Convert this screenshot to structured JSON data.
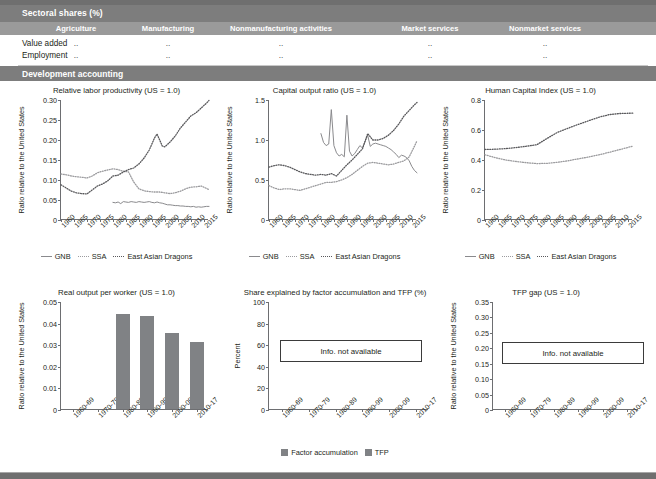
{
  "table": {
    "section_title": "Sectoral shares (%)",
    "columns": [
      "Agriculture",
      "Manufacturing",
      "Nonmanufacturing activities",
      "Market services",
      "Nonmarket services"
    ],
    "rows": [
      {
        "label": "Value added",
        "values": [
          "..",
          "..",
          "..",
          "..",
          ".."
        ]
      },
      {
        "label": "Employment",
        "values": [
          "..",
          "..",
          "..",
          "..",
          ".."
        ]
      }
    ],
    "section_title_2": "Development accounting"
  },
  "legend": {
    "gnb": "GNB",
    "ssa": "SSA",
    "ead": "East Asian Dragons",
    "factor_accumulation": "Factor accumulation",
    "tfp": "TFP"
  },
  "na_text": "Info. not available",
  "colors": {
    "band": "#7d7d7d",
    "colheader": "#9a9a9a",
    "gnb": "#8a8a8d",
    "ssa": "#9b9b9e",
    "ead": "#58585b",
    "bar": "#808285",
    "axis": "#6d6e71"
  },
  "chart_data": [
    {
      "id": "relative-labor-productivity",
      "type": "line",
      "title": "Relative labor productivity (US = 1.0)",
      "xlabel": "",
      "ylabel": "Ratio relative to the United States",
      "ylim": [
        0,
        0.3
      ],
      "yticks": [
        0,
        0.05,
        0.1,
        0.15,
        0.2,
        0.25,
        0.3
      ],
      "ytick_labels": [
        "0",
        "0.05",
        "0.10",
        "0.15",
        "0.20",
        "0.25",
        "0.30"
      ],
      "xlim": [
        1960,
        2017
      ],
      "xticks": [
        1960,
        1965,
        1970,
        1975,
        1980,
        1985,
        1990,
        1995,
        2000,
        2005,
        2010,
        2015
      ],
      "grid": false,
      "legend_position": "below",
      "series": [
        {
          "name": "GNB",
          "style": "solid",
          "x": [
            1980,
            1981,
            1982,
            1983,
            1984,
            1985,
            1986,
            1987,
            1988,
            1989,
            1990,
            1991,
            1992,
            1993,
            1994,
            1995,
            1996,
            1997,
            1998,
            1999,
            2000,
            2001,
            2002,
            2003,
            2004,
            2005,
            2006,
            2007,
            2008,
            2009,
            2010,
            2011,
            2012,
            2013,
            2014,
            2015,
            2016,
            2017
          ],
          "values": [
            0.044,
            0.043,
            0.045,
            0.041,
            0.046,
            0.045,
            0.044,
            0.046,
            0.045,
            0.044,
            0.046,
            0.045,
            0.044,
            0.045,
            0.046,
            0.044,
            0.043,
            0.045,
            0.043,
            0.042,
            0.04,
            0.038,
            0.038,
            0.037,
            0.036,
            0.036,
            0.035,
            0.035,
            0.034,
            0.034,
            0.033,
            0.034,
            0.032,
            0.033,
            0.032,
            0.033,
            0.034,
            0.034
          ]
        },
        {
          "name": "SSA",
          "style": "dotted",
          "x": [
            1960,
            1962,
            1964,
            1966,
            1968,
            1970,
            1972,
            1974,
            1976,
            1978,
            1980,
            1982,
            1984,
            1986,
            1988,
            1990,
            1992,
            1994,
            1996,
            1998,
            2000,
            2002,
            2004,
            2006,
            2008,
            2010,
            2012,
            2014,
            2016,
            2017
          ],
          "values": [
            0.115,
            0.113,
            0.11,
            0.108,
            0.107,
            0.105,
            0.11,
            0.118,
            0.122,
            0.125,
            0.128,
            0.126,
            0.122,
            0.12,
            0.095,
            0.078,
            0.073,
            0.071,
            0.07,
            0.07,
            0.068,
            0.066,
            0.068,
            0.072,
            0.078,
            0.082,
            0.083,
            0.085,
            0.079,
            0.076
          ]
        },
        {
          "name": "East Asian Dragons",
          "style": "dotted-dark",
          "x": [
            1960,
            1962,
            1964,
            1966,
            1968,
            1970,
            1972,
            1974,
            1976,
            1978,
            1980,
            1982,
            1984,
            1986,
            1988,
            1990,
            1992,
            1994,
            1996,
            1997,
            1998,
            1999,
            2000,
            2002,
            2004,
            2006,
            2008,
            2010,
            2012,
            2014,
            2016,
            2017
          ],
          "values": [
            0.088,
            0.08,
            0.072,
            0.068,
            0.066,
            0.065,
            0.075,
            0.085,
            0.09,
            0.098,
            0.11,
            0.112,
            0.12,
            0.126,
            0.13,
            0.14,
            0.155,
            0.175,
            0.205,
            0.215,
            0.2,
            0.185,
            0.183,
            0.195,
            0.21,
            0.23,
            0.245,
            0.26,
            0.268,
            0.28,
            0.292,
            0.299
          ]
        }
      ]
    },
    {
      "id": "capital-output-ratio",
      "type": "line",
      "title": "Capital output ratio (US = 1.0)",
      "xlabel": "",
      "ylabel": "Ratio relative to the United States",
      "ylim": [
        0,
        1.5
      ],
      "yticks": [
        0,
        0.5,
        1.0,
        1.5
      ],
      "ytick_labels": [
        "0",
        "0.5",
        "1.0",
        "1.5"
      ],
      "xlim": [
        1960,
        2017
      ],
      "xticks": [
        1960,
        1965,
        1970,
        1975,
        1980,
        1985,
        1990,
        1995,
        2000,
        2005,
        2010,
        2015
      ],
      "grid": false,
      "legend_position": "below",
      "series": [
        {
          "name": "GNB",
          "style": "solid",
          "x": [
            1980,
            1981,
            1982,
            1983,
            1984,
            1985,
            1986,
            1987,
            1988,
            1989,
            1990,
            1991,
            1992,
            1993,
            1994,
            1995,
            1996,
            1997,
            1998,
            1999,
            2000,
            2001,
            2002,
            2003,
            2004,
            2005,
            2006,
            2007,
            2008,
            2009,
            2010,
            2011,
            2012,
            2013,
            2014,
            2015,
            2016,
            2017
          ],
          "values": [
            1.08,
            0.97,
            0.93,
            0.95,
            1.38,
            0.93,
            0.84,
            0.8,
            0.82,
            0.79,
            1.31,
            0.86,
            0.8,
            0.83,
            0.88,
            0.93,
            0.9,
            0.98,
            1.06,
            0.92,
            0.95,
            0.96,
            0.95,
            0.94,
            0.93,
            0.92,
            0.9,
            0.88,
            0.85,
            0.82,
            0.78,
            0.81,
            0.8,
            0.78,
            0.74,
            0.67,
            0.62,
            0.59
          ]
        },
        {
          "name": "SSA",
          "style": "dotted",
          "x": [
            1960,
            1962,
            1964,
            1966,
            1968,
            1970,
            1972,
            1974,
            1976,
            1978,
            1980,
            1982,
            1984,
            1986,
            1988,
            1990,
            1992,
            1994,
            1996,
            1998,
            2000,
            2002,
            2004,
            2006,
            2008,
            2010,
            2012,
            2014,
            2016,
            2017
          ],
          "values": [
            0.43,
            0.4,
            0.38,
            0.39,
            0.39,
            0.38,
            0.37,
            0.39,
            0.41,
            0.43,
            0.45,
            0.47,
            0.47,
            0.48,
            0.5,
            0.53,
            0.57,
            0.62,
            0.67,
            0.71,
            0.72,
            0.71,
            0.7,
            0.69,
            0.7,
            0.72,
            0.74,
            0.79,
            0.92,
            0.99
          ]
        },
        {
          "name": "East Asian Dragons",
          "style": "dotted-dark",
          "x": [
            1960,
            1962,
            1964,
            1966,
            1968,
            1970,
            1972,
            1974,
            1976,
            1978,
            1980,
            1982,
            1984,
            1986,
            1988,
            1990,
            1992,
            1994,
            1996,
            1998,
            2000,
            2002,
            2004,
            2006,
            2008,
            2010,
            2012,
            2014,
            2016,
            2017
          ],
          "values": [
            0.66,
            0.68,
            0.69,
            0.68,
            0.66,
            0.63,
            0.6,
            0.58,
            0.57,
            0.56,
            0.57,
            0.56,
            0.58,
            0.55,
            0.62,
            0.69,
            0.75,
            0.82,
            0.89,
            1.08,
            1.0,
            1.0,
            1.02,
            1.06,
            1.12,
            1.2,
            1.3,
            1.37,
            1.44,
            1.47
          ]
        }
      ]
    },
    {
      "id": "human-capital-index",
      "type": "line",
      "title": "Human Capital Index (US = 1.0)",
      "xlabel": "",
      "ylabel": "Ratio relative to the United States",
      "ylim": [
        0,
        0.8
      ],
      "yticks": [
        0,
        0.2,
        0.4,
        0.6,
        0.8
      ],
      "ytick_labels": [
        "0",
        "0.2",
        "0.4",
        "0.6",
        "0.8"
      ],
      "xlim": [
        1960,
        2017
      ],
      "xticks": [
        1960,
        1965,
        1970,
        1975,
        1980,
        1985,
        1990,
        1995,
        2000,
        2005,
        2010,
        2015
      ],
      "grid": false,
      "legend_position": "below",
      "series": [
        {
          "name": "GNB",
          "style": "solid",
          "x": [],
          "values": []
        },
        {
          "name": "SSA",
          "style": "dotted",
          "x": [
            1960,
            1964,
            1968,
            1972,
            1976,
            1980,
            1984,
            1988,
            1992,
            1996,
            2000,
            2004,
            2008,
            2012,
            2016,
            2017
          ],
          "values": [
            0.435,
            0.415,
            0.4,
            0.39,
            0.382,
            0.376,
            0.378,
            0.385,
            0.395,
            0.408,
            0.42,
            0.435,
            0.452,
            0.47,
            0.488,
            0.492
          ]
        },
        {
          "name": "East Asian Dragons",
          "style": "dotted-dark",
          "x": [
            1960,
            1964,
            1968,
            1972,
            1976,
            1980,
            1984,
            1988,
            1992,
            1996,
            2000,
            2004,
            2008,
            2012,
            2016,
            2017
          ],
          "values": [
            0.47,
            0.472,
            0.476,
            0.483,
            0.492,
            0.502,
            0.545,
            0.585,
            0.612,
            0.638,
            0.662,
            0.686,
            0.703,
            0.71,
            0.712,
            0.712
          ]
        }
      ]
    },
    {
      "id": "real-output-per-worker",
      "type": "bar",
      "title": "Real output per worker (US = 1.0)",
      "xlabel": "",
      "ylabel": "Ratio relative to the United States",
      "ylim": [
        0,
        0.05
      ],
      "yticks": [
        0,
        0.01,
        0.02,
        0.03,
        0.04,
        0.05
      ],
      "ytick_labels": [
        "0",
        "0.01",
        "0.02",
        "0.03",
        "0.04",
        "0.05"
      ],
      "categories": [
        "1960-69",
        "1970-79",
        "1980-89",
        "1990-99",
        "2000-09",
        "2010-17"
      ],
      "values": [
        null,
        null,
        0.044,
        0.043,
        0.035,
        0.031
      ],
      "grid": false
    },
    {
      "id": "share-explained-factor-accumulation-tfp",
      "type": "bar",
      "title": "Share explained by factor accumulation and TFP (%)",
      "xlabel": "",
      "ylabel": "Percent",
      "ylim": [
        0,
        100
      ],
      "yticks": [
        0,
        20,
        40,
        60,
        80,
        100
      ],
      "ytick_labels": [
        "0",
        "20",
        "40",
        "60",
        "80",
        "100"
      ],
      "categories": [
        "1960-69",
        "1970-79",
        "1980-89",
        "1990-99",
        "2000-09",
        "2010-17"
      ],
      "series": [
        {
          "name": "Factor accumulation",
          "values": [
            null,
            null,
            null,
            null,
            null,
            null
          ]
        },
        {
          "name": "TFP",
          "values": [
            null,
            null,
            null,
            null,
            null,
            null
          ]
        }
      ],
      "annotation": "Info. not available",
      "grid": false,
      "legend_position": "below"
    },
    {
      "id": "tfp-gap",
      "type": "bar",
      "title": "TFP gap (US = 1.0)",
      "xlabel": "",
      "ylabel": "Ratio relative to the United States",
      "ylim": [
        0,
        0.35
      ],
      "yticks": [
        0,
        0.05,
        0.1,
        0.15,
        0.2,
        0.25,
        0.3,
        0.35
      ],
      "ytick_labels": [
        "0",
        "0.05",
        "0.10",
        "0.15",
        "0.20",
        "0.25",
        "0.30",
        "0.35"
      ],
      "categories": [
        "1960-69",
        "1970-79",
        "1980-89",
        "1990-99",
        "2000-09",
        "2010-17"
      ],
      "values": [
        null,
        null,
        null,
        null,
        null,
        null
      ],
      "annotation": "Info. not available",
      "grid": false
    }
  ]
}
